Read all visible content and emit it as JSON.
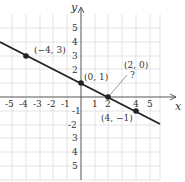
{
  "figure": {
    "type": "coordinate-plane-line",
    "axes": {
      "x_label": "x",
      "y_label": "y",
      "x_ticks": [
        "-5",
        "-4",
        "-3",
        "-2",
        "-1",
        "1",
        "2",
        "4",
        "5"
      ],
      "y_ticks_positive": [
        "1",
        "2",
        "3",
        "4",
        "5"
      ],
      "y_ticks_negative": [
        "-1",
        "-2",
        "3",
        "4",
        "5"
      ]
    },
    "points": [
      {
        "label": "(−4, 3)",
        "x": -4,
        "y": 3
      },
      {
        "label": "(0, 1)",
        "x": 0,
        "y": 1
      },
      {
        "label": "(2, 0)",
        "x": 2,
        "y": 0
      },
      {
        "label": "(4, −1)",
        "x": 4,
        "y": -1
      }
    ],
    "annotation": {
      "text": "?",
      "points_to": "(2, 0)"
    },
    "line": {
      "slope": -0.5,
      "intercept": 1
    },
    "colors": {
      "grid": "#dddddd",
      "axis": "#555555",
      "line": "#222222",
      "point": "#222222"
    }
  }
}
